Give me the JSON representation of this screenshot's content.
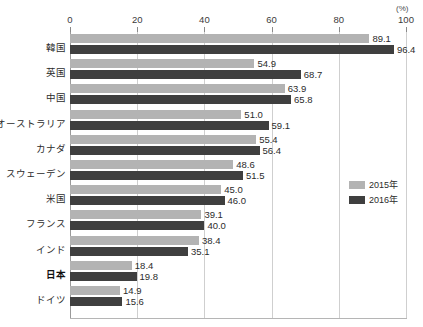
{
  "chart_data": {
    "type": "bar",
    "orientation": "horizontal",
    "title": "",
    "subtitle": "",
    "xlabel": "",
    "ylabel": "",
    "unit_label": "(%)",
    "xlim": [
      0,
      100
    ],
    "xticks": [
      0,
      20,
      40,
      60,
      80,
      100
    ],
    "xtick_labels": [
      "0",
      "20",
      "40",
      "60",
      "80",
      "100"
    ],
    "grid": true,
    "grid_axis": "x",
    "legend_position": "right",
    "emphasized_category": "日本",
    "categories": [
      "韓国",
      "英国",
      "中国",
      "オーストラリア",
      "カナダ",
      "スウェーデン",
      "米国",
      "フランス",
      "インド",
      "日本",
      "ドイツ"
    ],
    "series": [
      {
        "name": "2015年",
        "color": "#b3b3b3",
        "values": [
          89.1,
          54.9,
          63.9,
          51.0,
          55.4,
          48.6,
          45.0,
          39.1,
          38.4,
          18.4,
          14.9
        ],
        "value_labels": [
          "89.1",
          "54.9",
          "63.9",
          "51.0",
          "55.4",
          "48.6",
          "45.0",
          "39.1",
          "38.4",
          "18.4",
          "14.9"
        ]
      },
      {
        "name": "2016年",
        "color": "#3f3f3f",
        "values": [
          96.4,
          68.7,
          65.8,
          59.1,
          56.4,
          51.5,
          46.0,
          40.0,
          35.1,
          19.8,
          15.6
        ],
        "value_labels": [
          "96.4",
          "68.7",
          "65.8",
          "59.1",
          "56.4",
          "51.5",
          "46.0",
          "40.0",
          "35.1",
          "19.8",
          "15.6"
        ]
      }
    ]
  },
  "legend": {
    "items": [
      {
        "label": "2015年",
        "color": "#b3b3b3"
      },
      {
        "label": "2016年",
        "color": "#3f3f3f"
      }
    ]
  },
  "colors": {
    "series_2015": "#b3b3b3",
    "series_2016": "#3f3f3f",
    "grid": "#cfcfcf",
    "axis": "#9a9a9a",
    "text": "#2b2b2b",
    "background": "#ffffff"
  }
}
